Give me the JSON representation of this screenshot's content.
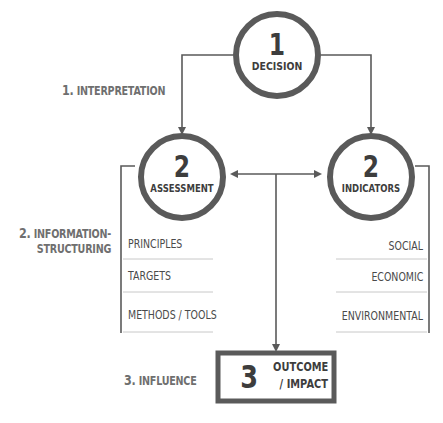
{
  "diagram": {
    "nodes": {
      "decision": {
        "number": "1",
        "label": "DECISION"
      },
      "assessment": {
        "number": "2",
        "label": "ASSESSMENT"
      },
      "indicators": {
        "number": "2",
        "label": "INDICATORS"
      },
      "outcome": {
        "number": "3",
        "label_line1": "OUTCOME",
        "label_line2": "/ IMPACT"
      }
    },
    "stages": {
      "interpretation": {
        "number": "1.",
        "label": "INTERPRETATION"
      },
      "information_structuring": {
        "number": "2.",
        "label_line1": "INFORMATION-",
        "label_line2": "STRUCTURING"
      },
      "influence": {
        "number": "3.",
        "label": "INFLUENCE"
      }
    },
    "assessment_items": [
      "PRINCIPLES",
      "TARGETS",
      "METHODS / TOOLS"
    ],
    "indicator_items": [
      "SOCIAL",
      "ECONOMIC",
      "ENVIRONMENTAL"
    ],
    "colors": {
      "stroke": "#5a5a5a",
      "text_dark": "#3d3d3d",
      "text_label": "#6f6f6f",
      "divider": "#c8c8c8"
    }
  }
}
